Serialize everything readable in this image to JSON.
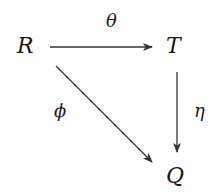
{
  "diagram": {
    "type": "commutative-diagram",
    "nodes": {
      "R": "R",
      "T": "T",
      "Q": "Q"
    },
    "edges": [
      {
        "from": "R",
        "to": "T",
        "label": "θ"
      },
      {
        "from": "T",
        "to": "Q",
        "label": "η"
      },
      {
        "from": "R",
        "to": "Q",
        "label": "ϕ"
      }
    ],
    "colors": {
      "stroke": "#333333",
      "text": "#1a1a1a",
      "background": "#ffffff"
    }
  }
}
